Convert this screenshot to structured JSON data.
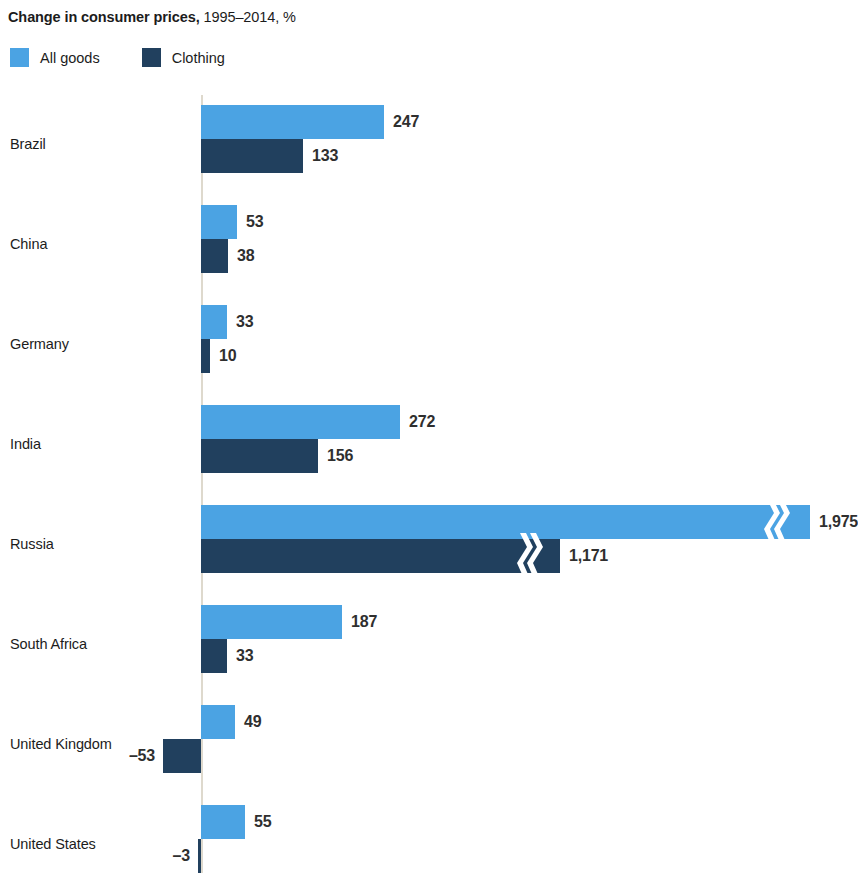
{
  "title": {
    "main": "Change in consumer prices,",
    "sub": " 1995–2014, %"
  },
  "legend": {
    "position": "top-left",
    "items": [
      {
        "label": "All goods",
        "color": "#4BA3E3",
        "key": "all_goods"
      },
      {
        "label": "Clothing",
        "color": "#21405E",
        "key": "clothing"
      }
    ]
  },
  "axis": {
    "baseline_value": 0,
    "baseline_color": "#ded9cd"
  },
  "chart_data": {
    "type": "bar",
    "orientation": "horizontal",
    "title": "Change in consumer prices, 1995–2014, %",
    "xlabel": "",
    "ylabel": "",
    "grid": false,
    "legend_position": "top-left",
    "categories": [
      "Brazil",
      "China",
      "Germany",
      "India",
      "Russia",
      "South Africa",
      "United Kingdom",
      "United States"
    ],
    "series": [
      {
        "name": "All goods",
        "color": "#4BA3E3",
        "values": [
          247,
          53,
          33,
          272,
          1975,
          187,
          49,
          55
        ],
        "labels": [
          "247",
          "53",
          "33",
          "272",
          "1,975",
          "187",
          "49",
          "55"
        ]
      },
      {
        "name": "Clothing",
        "color": "#21405E",
        "values": [
          133,
          38,
          10,
          156,
          1171,
          33,
          -53,
          -3
        ],
        "labels": [
          "133",
          "38",
          "10",
          "156",
          "1,171",
          "33",
          "–53",
          "–3"
        ]
      }
    ],
    "axis_breaks": [
      {
        "category": "Russia",
        "series": "All goods"
      },
      {
        "category": "Russia",
        "series": "Clothing"
      }
    ]
  },
  "rows": [
    {
      "label": "Brazil",
      "light": {
        "value": 247,
        "label": "247",
        "px_end": 384,
        "broken": false
      },
      "dark": {
        "value": 133,
        "label": "133",
        "px_end": 303,
        "broken": false
      }
    },
    {
      "label": "China",
      "light": {
        "value": 53,
        "label": "53",
        "px_end": 237,
        "broken": false
      },
      "dark": {
        "value": 38,
        "label": "38",
        "px_end": 228,
        "broken": false
      }
    },
    {
      "label": "Germany",
      "light": {
        "value": 33,
        "label": "33",
        "px_end": 227,
        "broken": false
      },
      "dark": {
        "value": 10,
        "label": "10",
        "px_end": 210,
        "broken": false
      }
    },
    {
      "label": "India",
      "light": {
        "value": 272,
        "label": "272",
        "px_end": 400,
        "broken": false
      },
      "dark": {
        "value": 156,
        "label": "156",
        "px_end": 318,
        "broken": false
      }
    },
    {
      "label": "Russia",
      "light": {
        "value": 1975,
        "label": "1,975",
        "px_end": 810,
        "broken": true,
        "break_px": 762
      },
      "dark": {
        "value": 1171,
        "label": "1,171",
        "px_end": 560,
        "broken": true,
        "break_px": 515
      }
    },
    {
      "label": "South Africa",
      "light": {
        "value": 187,
        "label": "187",
        "px_end": 342,
        "broken": false
      },
      "dark": {
        "value": 33,
        "label": "33",
        "px_end": 227,
        "broken": false
      }
    },
    {
      "label": "United Kingdom",
      "light": {
        "value": 49,
        "label": "49",
        "px_end": 235,
        "broken": false
      },
      "dark": {
        "value": -53,
        "label": "–53",
        "px_end": 163,
        "broken": false
      }
    },
    {
      "label": "United States",
      "light": {
        "value": 55,
        "label": "55",
        "px_end": 245,
        "broken": false
      },
      "dark": {
        "value": -3,
        "label": "–3",
        "px_end": 198,
        "broken": false
      }
    }
  ]
}
